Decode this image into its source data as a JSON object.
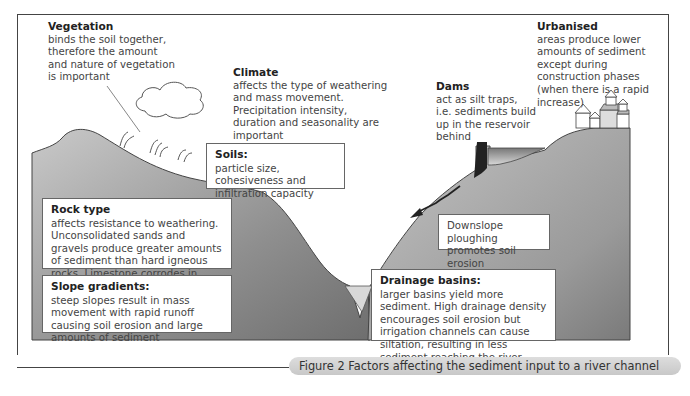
{
  "figure": {
    "caption": "Figure 2  Factors affecting the sediment input to a river channel"
  },
  "labels": {
    "vegetation": {
      "title": "Vegetation",
      "body": "binds the soil together, therefore the amount and nature of vegetation is important"
    },
    "climate": {
      "title": "Climate",
      "body": "affects the type of weathering and mass movement. Precipitation intensity, duration and seasonality are important"
    },
    "dams": {
      "title": "Dams",
      "body": "act as silt traps, i.e. sediments build up in the reservoir behind"
    },
    "urbanised": {
      "title": "Urbanised",
      "body": "areas produce lower amounts of sediment except during construction phases (when there is a rapid increase)"
    }
  },
  "boxes": {
    "soils": {
      "title": "Soils:",
      "body": "particle size, cohesiveness and infiltration capacity"
    },
    "rock_type": {
      "title": "Rock type",
      "body": "affects resistance to weathering. Unconsolidated sands and gravels produce greater amounts of sediment than hard igneous rocks. Limestone corrodes in solution and supplies very little sediment"
    },
    "slope_gradients": {
      "title": "Slope gradients:",
      "body": "steep slopes result in mass movement with rapid runoff causing soil erosion and large amounts of sediment"
    },
    "ploughing": {
      "body": "Downslope ploughing promotes soil erosion"
    },
    "drainage_basins": {
      "title": "Drainage basins:",
      "body": "larger basins yield more sediment. High drainage density encourages soil erosion but irrigation channels can cause siltation, resulting in less sediment reaching the river"
    }
  },
  "colors": {
    "land_dark": "#8c8c8c",
    "land_light": "#d4d4d4",
    "frame": "#444444",
    "caption_bg": "#d0d0d0"
  }
}
